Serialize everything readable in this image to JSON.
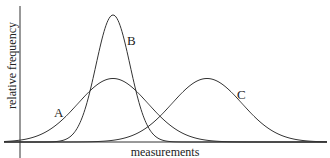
{
  "chart_data": {
    "type": "line",
    "title": "",
    "xlabel": "measurements",
    "ylabel": "relative frequency",
    "grid": false,
    "legend": "inline curve labels",
    "series": [
      {
        "name": "A",
        "mean": 113,
        "peak": 1.0,
        "sd": 35,
        "note": "wide, low peak centered same as B"
      },
      {
        "name": "B",
        "mean": 113,
        "peak": 2.0,
        "sd": 17,
        "note": "narrow, tall peak"
      },
      {
        "name": "C",
        "mean": 207,
        "peak": 1.0,
        "sd": 35,
        "note": "same spread as A, shifted right"
      }
    ],
    "annotations": [
      "A",
      "B",
      "C"
    ]
  },
  "labels": {
    "A": "A",
    "B": "B",
    "C": "C",
    "x": "measurements",
    "y": "relative frequency"
  }
}
